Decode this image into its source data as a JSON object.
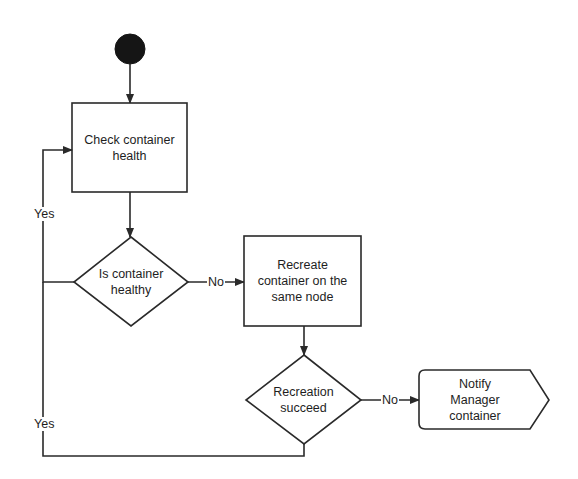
{
  "diagram": {
    "type": "flowchart",
    "nodes": {
      "start": {
        "shape": "filled-circle"
      },
      "check_health": {
        "shape": "rectangle",
        "label": "Check container\nhealth"
      },
      "is_healthy": {
        "shape": "diamond",
        "label": "Is container\nhealthy"
      },
      "recreate": {
        "shape": "rectangle",
        "label": "Recreate\ncontainer on the\nsame node"
      },
      "recreation_succeed": {
        "shape": "diamond",
        "label": "Recreation\nsucceed"
      },
      "notify_manager": {
        "shape": "display",
        "label": "Notify\nManager\ncontainer"
      }
    },
    "edges": {
      "start_to_check": {
        "from": "start",
        "to": "check_health",
        "label": ""
      },
      "check_to_healthy": {
        "from": "check_health",
        "to": "is_healthy",
        "label": ""
      },
      "healthy_yes": {
        "from": "is_healthy",
        "to": "check_health",
        "label": "Yes"
      },
      "healthy_no": {
        "from": "is_healthy",
        "to": "recreate",
        "label": "No"
      },
      "recreate_to_succeed": {
        "from": "recreate",
        "to": "recreation_succeed",
        "label": ""
      },
      "succeed_yes": {
        "from": "recreation_succeed",
        "to": "check_health",
        "label": "Yes"
      },
      "succeed_no": {
        "from": "recreation_succeed",
        "to": "notify_manager",
        "label": "No"
      }
    },
    "colors": {
      "stroke": "#2a2a2a",
      "fill": "#ffffff",
      "start_fill": "#151515",
      "text": "#1e1e1e"
    }
  }
}
